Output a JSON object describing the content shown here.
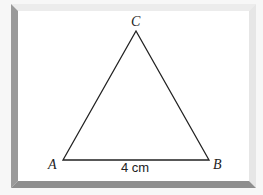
{
  "figure": {
    "type": "triangle",
    "vertices": {
      "A": {
        "label": "A",
        "x": 63,
        "y": 160
      },
      "B": {
        "label": "B",
        "x": 209,
        "y": 160
      },
      "C": {
        "label": "C",
        "x": 136,
        "y": 31
      }
    },
    "side_AB_label": "4 cm",
    "colors": {
      "stroke": "#222222",
      "background": "#ffffff",
      "frame_dark": "#9a9a9a",
      "frame_light": "#ececec"
    }
  }
}
